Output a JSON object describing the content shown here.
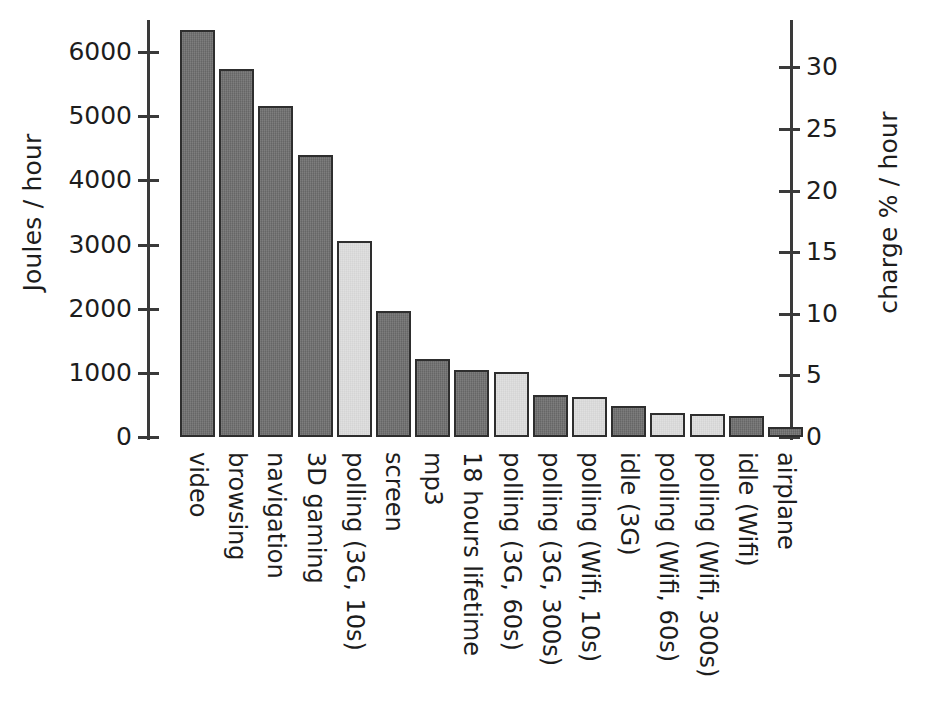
{
  "chart_data": {
    "type": "bar",
    "title": "",
    "subtitle": "",
    "xlabel": "",
    "ylabel": "Joules / hour",
    "y2label": "charge %  / hour",
    "ylim": [
      0,
      6600
    ],
    "y2lim": [
      0,
      34.4
    ],
    "yticks": [
      0,
      1000,
      2000,
      3000,
      4000,
      5000,
      6000
    ],
    "y2ticks": [
      0,
      5,
      10,
      15,
      20,
      25,
      30
    ],
    "grid": false,
    "legend": "none",
    "units": {
      "left": "Joules / hour",
      "right": "charge % / hour",
      "joules_per_percent": 192
    },
    "categories": [
      "video",
      "browsing",
      "navigation",
      "3D gaming",
      "polling (3G, 10s)",
      "screen",
      "mp3",
      "18 hours lifetime",
      "polling (3G, 60s)",
      "polling (3G, 300s)",
      "polling (Wifi, 10s)",
      "idle (3G)",
      "polling (Wifi, 60s)",
      "polling (Wifi, 300s)",
      "idle (Wifi)",
      "airplane"
    ],
    "values": [
      6350,
      5730,
      5160,
      4400,
      3060,
      1970,
      1220,
      1040,
      1020,
      650,
      620,
      480,
      370,
      360,
      330,
      150
    ],
    "values_charge_percent": [
      33.1,
      29.8,
      26.9,
      22.9,
      15.9,
      10.3,
      6.4,
      5.4,
      5.3,
      3.4,
      3.2,
      2.5,
      1.9,
      1.9,
      1.7,
      0.8
    ],
    "bar_shades": [
      "dark",
      "dark",
      "dark",
      "dark",
      "light",
      "dark",
      "dark",
      "dark",
      "light",
      "dark",
      "light",
      "dark",
      "light",
      "light",
      "dark",
      "dark"
    ],
    "colors": {
      "bar_dark": "#6d6d6d",
      "bar_light": "#dedede",
      "bar_border": "#2e2e2e",
      "axis": "#3a3a3a",
      "text": "#1d1d1d",
      "background": "#ffffff"
    }
  }
}
